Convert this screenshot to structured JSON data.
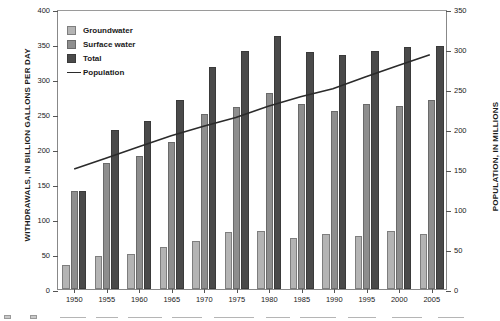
{
  "chart_data": {
    "type": "bar",
    "title": "",
    "subtitle": "",
    "xlabel": "",
    "ylabel": "WITHDRAWALS, IN BILLION GALLONS PER DAY",
    "y2label": "POPULATION, IN MILLIONS",
    "categories": [
      "1950",
      "1955",
      "1960",
      "1965",
      "1970",
      "1975",
      "1980",
      "1985",
      "1990",
      "1995",
      "2000",
      "2005"
    ],
    "ylim": [
      0,
      400
    ],
    "yticks": [
      0,
      50,
      100,
      150,
      200,
      250,
      300,
      350,
      400
    ],
    "y2lim": [
      0,
      350
    ],
    "y2ticks": [
      0,
      50,
      100,
      150,
      200,
      250,
      300,
      350
    ],
    "grid": false,
    "legend_position": "upper-left",
    "series": [
      {
        "name": "Groundwater",
        "type": "bar",
        "axis": "left",
        "color": "#b4b4b4",
        "values": [
          34,
          47,
          50,
          60,
          68,
          82,
          83,
          73,
          79,
          76,
          83,
          79
        ]
      },
      {
        "name": "Surface water",
        "type": "bar",
        "axis": "left",
        "color": "#8e8e8e",
        "values": [
          140,
          180,
          190,
          210,
          250,
          260,
          280,
          265,
          255,
          264,
          262,
          270
        ]
      },
      {
        "name": "Total",
        "type": "bar",
        "axis": "left",
        "color": "#4a4a4a",
        "values": [
          140,
          227,
          240,
          270,
          317,
          340,
          361,
          339,
          334,
          340,
          346,
          347
        ]
      },
      {
        "name": "Population",
        "type": "line",
        "axis": "right",
        "color": "#2b2b2b",
        "values": [
          151,
          165,
          179,
          193,
          205,
          216,
          230,
          242,
          252,
          267,
          281,
          295
        ]
      }
    ],
    "legend": [
      {
        "label": "Groundwater",
        "marker": "square",
        "color": "#b4b4b4"
      },
      {
        "label": "Surface water",
        "marker": "square",
        "color": "#8e8e8e"
      },
      {
        "label": "Total",
        "marker": "square",
        "color": "#4a4a4a"
      },
      {
        "label": "Population",
        "marker": "line",
        "color": "#2b2b2b"
      }
    ]
  },
  "axes": {
    "left_title": "WITHDRAWALS, IN BILLION GALLONS PER DAY",
    "right_title": "POPULATION, IN MILLIONS"
  }
}
